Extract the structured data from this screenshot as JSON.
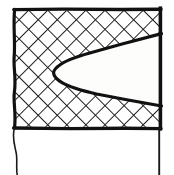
{
  "figure": {
    "style": "monochrome ink line drawing",
    "background_color": "#ffffff"
  },
  "canvas": {
    "width": 174,
    "height": 175
  },
  "colors": {
    "ink": "#111111",
    "hatch": "#1a1a1a",
    "notch_fill": "#fdfdfb",
    "block_fill": "#ffffff",
    "background": "#ffffff"
  },
  "geometry": {
    "block": {
      "name": "hatched-block",
      "left": 14,
      "top": 9,
      "right": 161,
      "bottom": 128,
      "outline_width": 3.4
    },
    "notch": {
      "name": "wedge-notch",
      "shape": "V-wedge opening to the right with rounded tip",
      "tip_x": 58,
      "tip_y": 71,
      "tip_radius": 12,
      "upper_arm_end_x": 161,
      "upper_arm_end_y": 34,
      "lower_arm_end_x": 161,
      "lower_arm_end_y": 104,
      "outline_width": 3.2
    },
    "hatch": {
      "name": "cross-hatch-fill",
      "pattern": "diagonal cross-hatch",
      "cell_size": 13.5,
      "angle_degrees": 45,
      "stroke_width": 1.9
    },
    "left_tail": {
      "name": "left-extension-line",
      "from_x": 14,
      "from_y": 128,
      "to_x": 17,
      "to_y": 175,
      "stroke_width": 1.6
    },
    "right_tail": {
      "name": "right-extension-line",
      "from_x": 159,
      "from_y": 128,
      "to_x": 159,
      "to_y": 175,
      "stroke_width": 1.9
    }
  },
  "labels": {
    "visible_text": []
  }
}
